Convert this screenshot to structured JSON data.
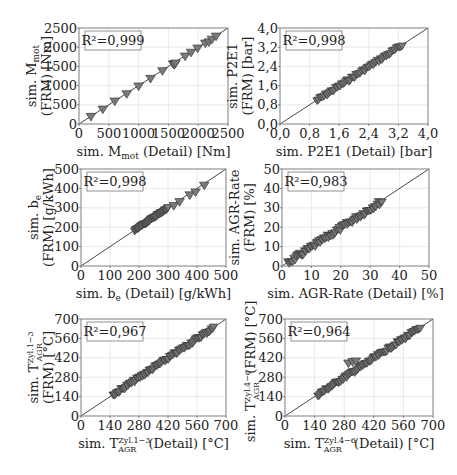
{
  "chart_data": [
    {
      "type": "scatter",
      "id": "m_mot",
      "title": "",
      "xlabel": "sim. M_mot (Detail) [Nm]",
      "ylabel_line1": "sim. M_mot",
      "ylabel_line2": "(FRM) [Nm]",
      "r2": "R²=0,999",
      "xlim": [
        0,
        2500
      ],
      "ylim": [
        0,
        2500
      ],
      "xticks": [
        0,
        500,
        1000,
        1500,
        2000,
        2500
      ],
      "yticks": [
        0,
        500,
        1000,
        1500,
        2000,
        2500
      ],
      "xtick_labels": [
        "0",
        "500",
        "1000",
        "1500",
        "2000",
        "2500"
      ],
      "ytick_labels": [
        "0",
        "500",
        "1000",
        "1500",
        "2000",
        "2500"
      ],
      "grid": true,
      "diagonal": true,
      "points": [
        [
          200,
          190
        ],
        [
          400,
          380
        ],
        [
          600,
          590
        ],
        [
          800,
          780
        ],
        [
          1000,
          980
        ],
        [
          1200,
          1180
        ],
        [
          1400,
          1380
        ],
        [
          1580,
          1560
        ],
        [
          1600,
          1540
        ],
        [
          1620,
          1580
        ],
        [
          1780,
          1760
        ],
        [
          1880,
          1860
        ],
        [
          1990,
          1970
        ],
        [
          2120,
          2100
        ],
        [
          2180,
          2130
        ],
        [
          2230,
          2200
        ],
        [
          2300,
          2280
        ]
      ],
      "frame": {
        "x": 79,
        "y": 28,
        "w": 149,
        "h": 96
      }
    },
    {
      "type": "scatter",
      "id": "p2e1",
      "xlabel": "sim. P2E1 (Detail) [bar]",
      "ylabel_line1": "sim. P2E1",
      "ylabel_line2": "(FRM) [bar]",
      "r2": "R²=0,998",
      "xlim": [
        0,
        4.0
      ],
      "ylim": [
        0,
        4.0
      ],
      "xticks": [
        0,
        0.8,
        1.6,
        2.4,
        3.2,
        4.0
      ],
      "yticks": [
        0,
        0.8,
        1.6,
        2.4,
        3.2,
        4.0
      ],
      "xtick_labels": [
        "0,0",
        "0,8",
        "1,6",
        "2,4",
        "3,2",
        "4,0"
      ],
      "ytick_labels": [
        "0,0",
        "0,8",
        "1,6",
        "2,4",
        "3,2",
        "4,0"
      ],
      "grid": true,
      "diagonal": true,
      "band": {
        "x0": 1.0,
        "x1": 3.3,
        "spread": 0.12,
        "n": 60
      },
      "frame": {
        "x": 280,
        "y": 28,
        "w": 148,
        "h": 96
      }
    },
    {
      "type": "scatter",
      "id": "b_e",
      "xlabel": "sim. b_e (Detail) [g/kWh]",
      "ylabel_line1": "sim. b_e",
      "ylabel_line2": "(FRM) [g/kWh]",
      "r2": "R²=0,998",
      "xlim": [
        0,
        500
      ],
      "ylim": [
        0,
        500
      ],
      "xticks": [
        0,
        100,
        200,
        300,
        400,
        500
      ],
      "yticks": [
        0,
        100,
        200,
        300,
        400,
        500
      ],
      "xtick_labels": [
        "0",
        "100",
        "200",
        "300",
        "400",
        "500"
      ],
      "ytick_labels": [
        "0",
        "100",
        "200",
        "300",
        "400",
        "500"
      ],
      "grid": true,
      "diagonal": true,
      "band": {
        "x0": 185,
        "x1": 300,
        "spread": 8,
        "n": 45
      },
      "points": [
        [
          320,
          310
        ],
        [
          340,
          330
        ],
        [
          375,
          365
        ],
        [
          395,
          380
        ],
        [
          425,
          415
        ]
      ],
      "frame": {
        "x": 81,
        "y": 169,
        "w": 145,
        "h": 97
      }
    },
    {
      "type": "scatter",
      "id": "agr_rate",
      "xlabel": "sim. AGR-Rate (Detail) [%]",
      "ylabel_line1": "sim. AGR-Rate",
      "ylabel_line2": "(FRM) [%]",
      "r2": "R²=0,983",
      "xlim": [
        0,
        50
      ],
      "ylim": [
        0,
        50
      ],
      "xticks": [
        0,
        10,
        20,
        30,
        40,
        50
      ],
      "yticks": [
        0,
        10,
        20,
        30,
        40,
        50
      ],
      "xtick_labels": [
        "0",
        "10",
        "20",
        "30",
        "40",
        "50"
      ],
      "ytick_labels": [
        "0",
        "10",
        "20",
        "30",
        "40",
        "50"
      ],
      "grid": true,
      "diagonal": true,
      "band": {
        "x0": 2,
        "x1": 34,
        "spread": 2.5,
        "n": 80
      },
      "frame": {
        "x": 282,
        "y": 169,
        "w": 147,
        "h": 97
      }
    },
    {
      "type": "scatter",
      "id": "t_agr_zyl1_3",
      "xlabel": "sim. T_AGR^Zyl.1−3 (Detail) [°C]",
      "xlabel_main": "sim. T",
      "xlabel_sup": "Zyl.1−3",
      "xlabel_sub": "AGR",
      "xlabel_tail": " (Detail) [°C]",
      "ylabel_line1": "sim. T_AGR^Zyl.1−3",
      "ylabel_line2": "(FRM) [°C]",
      "r2": "R²=0,967",
      "xlim": [
        0,
        700
      ],
      "ylim": [
        0,
        700
      ],
      "xticks": [
        0,
        140,
        280,
        420,
        560,
        700
      ],
      "yticks": [
        0,
        140,
        280,
        420,
        560,
        700
      ],
      "xtick_labels": [
        "0",
        "140",
        "280",
        "420",
        "560",
        "700"
      ],
      "ytick_labels": [
        "0",
        "140",
        "280",
        "420",
        "560",
        "700"
      ],
      "grid": true,
      "diagonal": true,
      "band": {
        "x0": 155,
        "x1": 640,
        "spread": 22,
        "n": 90
      },
      "frame": {
        "x": 81,
        "y": 319,
        "w": 145,
        "h": 97
      }
    },
    {
      "type": "scatter",
      "id": "t_agr_zyl4_6",
      "xlabel": "sim. T_AGR^Zyl.4−6 (Detail) [°C]",
      "xlabel_main": "sim. T",
      "xlabel_sup": "Zyl.4−6",
      "xlabel_sub": "AGR",
      "xlabel_tail": " (Detail) [°C]",
      "ylabel_line1": "sim. T_AGR^Zyl.4−6 (FRM) [°C]",
      "r2": "R²=0,964",
      "xlim": [
        0,
        700
      ],
      "ylim": [
        0,
        700
      ],
      "xticks": [
        0,
        140,
        280,
        420,
        560,
        700
      ],
      "yticks": [
        0,
        140,
        280,
        420,
        560,
        700
      ],
      "xtick_labels": [
        "0",
        "140",
        "280",
        "420",
        "560",
        "700"
      ],
      "ytick_labels": [
        "0",
        "140",
        "280",
        "420",
        "560",
        "700"
      ],
      "grid": true,
      "diagonal": true,
      "band": {
        "x0": 155,
        "x1": 640,
        "spread": 22,
        "n": 90
      },
      "points": [
        [
          300,
          380
        ],
        [
          320,
          390
        ],
        [
          335,
          395
        ]
      ],
      "frame": {
        "x": 285,
        "y": 319,
        "w": 148,
        "h": 97
      }
    }
  ]
}
